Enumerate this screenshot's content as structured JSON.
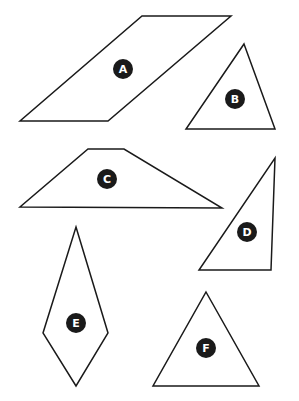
{
  "diagram": {
    "background": "#ffffff",
    "stroke_color": "#1a1a1a",
    "badge_color": "#1a1a1a",
    "badge_text_color": "#ffffff",
    "shapes": [
      {
        "label": "A",
        "kind": "parallelogram",
        "points": "142,16 231,16 108,121 20,121",
        "badge": {
          "cx": 123,
          "cy": 69
        }
      },
      {
        "label": "B",
        "kind": "triangle",
        "points": "244,44 275,129 186,129",
        "badge": {
          "cx": 235,
          "cy": 99
        }
      },
      {
        "label": "C",
        "kind": "trapezoid",
        "points": "88,149 124,149 222,208 20,207",
        "badge": {
          "cx": 107,
          "cy": 179
        }
      },
      {
        "label": "D",
        "kind": "right-triangle",
        "points": "275,158 271,270 199,270",
        "badge": {
          "cx": 247,
          "cy": 232
        }
      },
      {
        "label": "E",
        "kind": "kite",
        "points": "76,227 108,333 76,386 43,333",
        "badge": {
          "cx": 76,
          "cy": 323
        }
      },
      {
        "label": "F",
        "kind": "triangle",
        "points": "206,292 259,386 153,386",
        "badge": {
          "cx": 206,
          "cy": 348
        }
      }
    ]
  }
}
